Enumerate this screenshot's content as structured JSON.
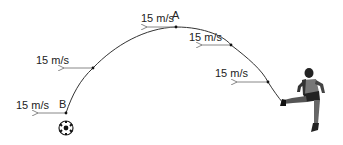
{
  "diagram": {
    "type": "projectile-trajectory",
    "points": {
      "A": "A",
      "B": "B"
    },
    "velocity_labels": [
      {
        "text": "15 m/s",
        "position": "near-B"
      },
      {
        "text": "15 m/s",
        "position": "left-upper"
      },
      {
        "text": "15 m/s",
        "position": "near-A-top"
      },
      {
        "text": "15 m/s",
        "position": "right-upper"
      },
      {
        "text": "15 m/s",
        "position": "right-lower"
      }
    ],
    "arrow_direction": "left",
    "figures": {
      "kicker": "soccer-player-kicking",
      "ball": "soccer-ball"
    },
    "colors": {
      "curve": "#333333",
      "arrow": "#888888",
      "text": "#222222"
    }
  }
}
